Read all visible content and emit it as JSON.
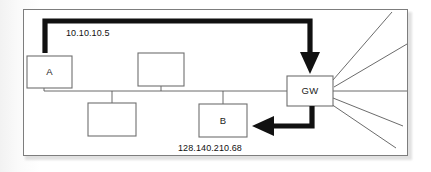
{
  "diagram": {
    "panel": {
      "border_color": "#7d7d7d",
      "background": "#ffffff"
    },
    "nodes": [
      {
        "id": "host-a",
        "label": "A",
        "x": 27,
        "y": 56,
        "w": 45,
        "h": 32,
        "labeled": true
      },
      {
        "id": "host-2",
        "label": "",
        "x": 138,
        "y": 53,
        "w": 46,
        "h": 33,
        "labeled": false
      },
      {
        "id": "host-3",
        "label": "",
        "x": 88,
        "y": 103,
        "w": 48,
        "h": 33,
        "labeled": false
      },
      {
        "id": "host-b",
        "label": "B",
        "x": 199,
        "y": 104,
        "w": 48,
        "h": 33,
        "labeled": true
      },
      {
        "id": "gateway",
        "label": "GW",
        "x": 287,
        "y": 76,
        "w": 46,
        "h": 30,
        "labeled": true
      }
    ],
    "labels": {
      "source_ip": "10.10.10.5",
      "destination_ip": "128.140.210.68",
      "gateway": "GW",
      "host_a": "A",
      "host_b": "B"
    },
    "flows": [
      {
        "id": "outbound-flow",
        "from": "host-a",
        "to": "gateway",
        "label": "10.10.10.5",
        "direction": "down-into-gateway",
        "style": "thick-elbow-arrow"
      },
      {
        "id": "inbound-flow",
        "from": "gateway",
        "to": "host-b",
        "label": "128.140.210.68",
        "direction": "left-into-host-b",
        "style": "thick-elbow-arrow"
      }
    ],
    "bus": {
      "id": "ethernet-bus",
      "y": 91,
      "x_start": 31,
      "x_end": 287
    },
    "wan_links": {
      "count": 5,
      "origin": "gateway",
      "description": "fan of lines radiating right from gateway"
    },
    "colors": {
      "line": "#5a5a5a",
      "thick_arrow": "#111111",
      "node_stroke": "#6f6f6f",
      "text": "#1c1c1c"
    }
  }
}
